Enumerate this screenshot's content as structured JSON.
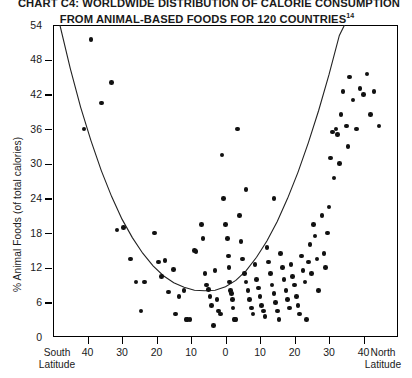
{
  "chart_data": {
    "type": "scatter",
    "title": "CHART C4: WORLDWIDE DISTRIBUTION OF CALORIE CONSUMPTION FROM ANIMAL-BASED FOODS FOR 120 COUNTRIES",
    "title_line1": "CHART C4: WORLDWIDE DISTRIBUTION OF CALORIE CONSUMPTION",
    "title_line2": "FROM ANIMAL-BASED FOODS FOR 120 COUNTRIES",
    "title_footnote": "14",
    "xlabel": "Latitude",
    "ylabel": "% Animal Foods (of total calories)",
    "xlim": [
      -50,
      50
    ],
    "ylim": [
      0,
      54
    ],
    "grid": false,
    "legend": null,
    "x_axis_left_label_line1": "South",
    "x_axis_left_label_line2": "Latitude",
    "x_axis_right_label_line1": "North",
    "x_axis_right_label_line2": "Latitude",
    "yticks": [
      0,
      6,
      12,
      18,
      24,
      30,
      36,
      42,
      48,
      54
    ],
    "xticks": [
      -40,
      -30,
      -20,
      -10,
      0,
      10,
      20,
      30,
      40
    ],
    "xtick_labels": [
      "40",
      "30",
      "20",
      "10",
      "0",
      "10",
      "20",
      "30",
      "40"
    ],
    "marker_color": "#111111",
    "curve_color": "#222222",
    "axis_color": "#000000",
    "fit_curve": {
      "type": "parabola",
      "description": "U-shaped quadratic trend line, minimum near 5 degrees south latitude at about 8 percent animal foods, rising to 54 percent at both latitude extremes",
      "vertex_x": -5,
      "vertex_y": 8,
      "points": [
        [
          -48,
          54
        ],
        [
          -45,
          46.5
        ],
        [
          -42,
          39.8
        ],
        [
          -39,
          34.0
        ],
        [
          -36,
          28.8
        ],
        [
          -33,
          24.3
        ],
        [
          -30,
          20.4
        ],
        [
          -27,
          17.2
        ],
        [
          -24,
          14.5
        ],
        [
          -21,
          12.3
        ],
        [
          -18,
          10.6
        ],
        [
          -15,
          9.4
        ],
        [
          -12,
          8.6
        ],
        [
          -9,
          8.1
        ],
        [
          -6,
          8.0
        ],
        [
          -3,
          8.1
        ],
        [
          0,
          8.7
        ],
        [
          3,
          9.8
        ],
        [
          6,
          11.5
        ],
        [
          9,
          13.8
        ],
        [
          12,
          16.6
        ],
        [
          15,
          20.0
        ],
        [
          18,
          24.0
        ],
        [
          21,
          28.5
        ],
        [
          24,
          33.6
        ],
        [
          27,
          39.2
        ],
        [
          30,
          45.4
        ],
        [
          33,
          52.2
        ],
        [
          34.5,
          54
        ]
      ]
    },
    "points": [
      [
        -39.0,
        51.5
      ],
      [
        -33.0,
        44.0
      ],
      [
        -36.0,
        40.5
      ],
      [
        -31.5,
        18.5
      ],
      [
        -29.5,
        19.0
      ],
      [
        -26.0,
        9.5
      ],
      [
        -23.5,
        9.5
      ],
      [
        -24.5,
        4.5
      ],
      [
        -20.5,
        18.0
      ],
      [
        -19.5,
        13.0
      ],
      [
        -17.5,
        13.2
      ],
      [
        -18.5,
        10.5
      ],
      [
        -16.5,
        7.8
      ],
      [
        -15.0,
        11.7
      ],
      [
        -13.5,
        7.0
      ],
      [
        -14.5,
        4.0
      ],
      [
        -12.0,
        8.0
      ],
      [
        -11.5,
        3.0
      ],
      [
        -11.0,
        3.0
      ],
      [
        -10.3,
        3.0
      ],
      [
        -9.0,
        15.0
      ],
      [
        -8.5,
        14.8
      ],
      [
        -7.0,
        19.5
      ],
      [
        -6.5,
        17.0
      ],
      [
        -6.0,
        11.0
      ],
      [
        -5.5,
        9.0
      ],
      [
        -5.0,
        8.2
      ],
      [
        -4.5,
        7.0
      ],
      [
        -4.0,
        5.5
      ],
      [
        -3.5,
        2.0
      ],
      [
        -3.0,
        11.5
      ],
      [
        -2.5,
        6.5
      ],
      [
        -2.0,
        4.5
      ],
      [
        -1.5,
        4.0
      ],
      [
        -1.0,
        31.5
      ],
      [
        -0.5,
        24.0
      ],
      [
        0.0,
        19.5
      ],
      [
        0.5,
        17.0
      ],
      [
        0.8,
        14.0
      ],
      [
        1.0,
        12.0
      ],
      [
        1.2,
        9.5
      ],
      [
        1.5,
        8.0
      ],
      [
        1.8,
        7.5
      ],
      [
        2.0,
        6.5
      ],
      [
        2.2,
        5.0
      ],
      [
        2.5,
        3.0
      ],
      [
        2.8,
        3.0
      ],
      [
        3.0,
        3.0
      ],
      [
        3.5,
        36.0
      ],
      [
        4.0,
        21.0
      ],
      [
        4.5,
        16.5
      ],
      [
        5.0,
        13.5
      ],
      [
        5.5,
        11.0
      ],
      [
        6.0,
        9.5
      ],
      [
        6.5,
        8.0
      ],
      [
        7.0,
        6.5
      ],
      [
        7.5,
        5.0
      ],
      [
        8.0,
        4.0
      ],
      [
        8.5,
        12.5
      ],
      [
        9.0,
        10.0
      ],
      [
        9.5,
        8.5
      ],
      [
        10.0,
        7.0
      ],
      [
        10.5,
        5.5
      ],
      [
        11.0,
        4.5
      ],
      [
        11.5,
        3.5
      ],
      [
        12.0,
        15.5
      ],
      [
        12.5,
        13.0
      ],
      [
        13.0,
        11.0
      ],
      [
        13.5,
        9.0
      ],
      [
        14.0,
        7.5
      ],
      [
        14.5,
        6.0
      ],
      [
        15.0,
        4.5
      ],
      [
        15.5,
        3.0
      ],
      [
        16.0,
        14.5
      ],
      [
        16.5,
        12.0
      ],
      [
        17.0,
        10.0
      ],
      [
        17.5,
        8.0
      ],
      [
        18.0,
        6.5
      ],
      [
        18.5,
        5.0
      ],
      [
        19.0,
        12.5
      ],
      [
        19.5,
        10.5
      ],
      [
        20.0,
        9.0
      ],
      [
        20.5,
        7.0
      ],
      [
        21.0,
        5.5
      ],
      [
        21.5,
        4.0
      ],
      [
        22.0,
        14.0
      ],
      [
        22.5,
        11.5
      ],
      [
        23.0,
        9.5
      ],
      [
        23.5,
        3.0
      ],
      [
        24.0,
        13.0
      ],
      [
        24.5,
        16.0
      ],
      [
        25.0,
        11.0
      ],
      [
        25.5,
        19.5
      ],
      [
        26.0,
        17.5
      ],
      [
        26.5,
        13.5
      ],
      [
        27.0,
        8.0
      ],
      [
        28.0,
        21.0
      ],
      [
        28.5,
        14.5
      ],
      [
        29.0,
        12.0
      ],
      [
        29.5,
        18.0
      ],
      [
        30.0,
        22.5
      ],
      [
        30.5,
        31.0
      ],
      [
        31.0,
        35.5
      ],
      [
        31.5,
        27.5
      ],
      [
        32.0,
        36.0
      ],
      [
        32.5,
        35.0
      ],
      [
        33.0,
        30.0
      ],
      [
        33.5,
        38.5
      ],
      [
        34.0,
        42.5
      ],
      [
        35.0,
        36.5
      ],
      [
        35.5,
        33.0
      ],
      [
        36.0,
        45.0
      ],
      [
        37.0,
        41.0
      ],
      [
        38.0,
        36.0
      ],
      [
        39.0,
        43.0
      ],
      [
        40.0,
        42.0
      ],
      [
        41.0,
        45.5
      ],
      [
        42.0,
        38.5
      ],
      [
        43.0,
        42.5
      ],
      [
        44.5,
        36.5
      ],
      [
        -41.0,
        36.0
      ],
      [
        -27.5,
        13.5
      ],
      [
        14.0,
        24.0
      ],
      [
        6.0,
        25.5
      ]
    ]
  }
}
